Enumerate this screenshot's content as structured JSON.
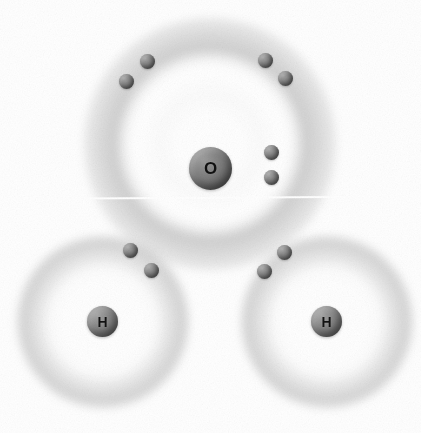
{
  "figure": {
    "background_color": "#ffffff",
    "width": 421,
    "height": 433
  },
  "atoms": [
    {
      "id": "oxygen",
      "symbol": "O",
      "name": "oxygen",
      "center": {
        "x": 210,
        "y": 168
      },
      "nucleus_radius": 21,
      "nucleus_color": "#7d7d7d",
      "shells": [
        {
          "index": 1,
          "radius": 46,
          "electron_count": 2
        },
        {
          "index": 2,
          "radius": 125,
          "electron_count": 6
        }
      ]
    },
    {
      "id": "hydrogen-left",
      "symbol": "H",
      "name": "hydrogen",
      "center": {
        "x": 103,
        "y": 322
      },
      "nucleus_radius": 15,
      "nucleus_color": "#848484",
      "shells": [
        {
          "index": 1,
          "radius": 85,
          "electron_count": 1
        }
      ]
    },
    {
      "id": "hydrogen-right",
      "symbol": "H",
      "name": "hydrogen",
      "center": {
        "x": 327,
        "y": 322
      },
      "nucleus_radius": 15,
      "nucleus_color": "#848484",
      "shells": [
        {
          "index": 1,
          "radius": 85,
          "electron_count": 1
        }
      ]
    }
  ],
  "electrons": [
    {
      "id": "e1",
      "group": "oxygen-lone-pair-upper-left",
      "x": 126,
      "y": 81,
      "color": "#6a6a6a"
    },
    {
      "id": "e2",
      "group": "oxygen-lone-pair-upper-left",
      "x": 147,
      "y": 61,
      "color": "#6a6a6a"
    },
    {
      "id": "e3",
      "group": "oxygen-lone-pair-upper-right",
      "x": 265,
      "y": 60,
      "color": "#6a6a6a"
    },
    {
      "id": "e4",
      "group": "oxygen-lone-pair-upper-right",
      "x": 285,
      "y": 78,
      "color": "#6a6a6a"
    },
    {
      "id": "e5",
      "group": "oxygen-lone-pair-right",
      "x": 271,
      "y": 152,
      "color": "#6a6a6a"
    },
    {
      "id": "e6",
      "group": "oxygen-lone-pair-right",
      "x": 271,
      "y": 177,
      "color": "#6a6a6a"
    },
    {
      "id": "e7",
      "group": "bonding-pair-left",
      "x": 130,
      "y": 250,
      "color": "#6a6a6a"
    },
    {
      "id": "e8",
      "group": "bonding-pair-left",
      "x": 151,
      "y": 270,
      "color": "#6a6a6a"
    },
    {
      "id": "e9",
      "group": "bonding-pair-right",
      "x": 284,
      "y": 252,
      "color": "#6a6a6a"
    },
    {
      "id": "e10",
      "group": "bonding-pair-right",
      "x": 264,
      "y": 271,
      "color": "#6a6a6a"
    }
  ],
  "artifacts": {
    "scanline": {
      "label": "white horizontal scan line",
      "y": 198,
      "color": "#ffffff"
    }
  }
}
